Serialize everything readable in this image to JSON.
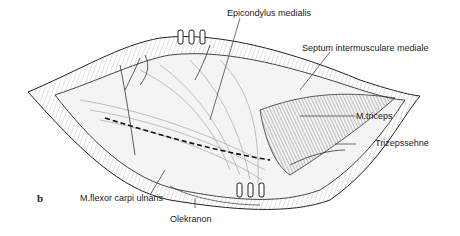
{
  "figure": {
    "panel_letter": "b",
    "labels": {
      "epicondylus": "Epicondylus medialis",
      "septum": "Septum intermusculare mediale",
      "triceps": "M.triceps",
      "trizepssehne": "Trizepssehne",
      "flexor": "M.flexor carpi ulnaris",
      "olekranon": "Olekranon"
    }
  }
}
